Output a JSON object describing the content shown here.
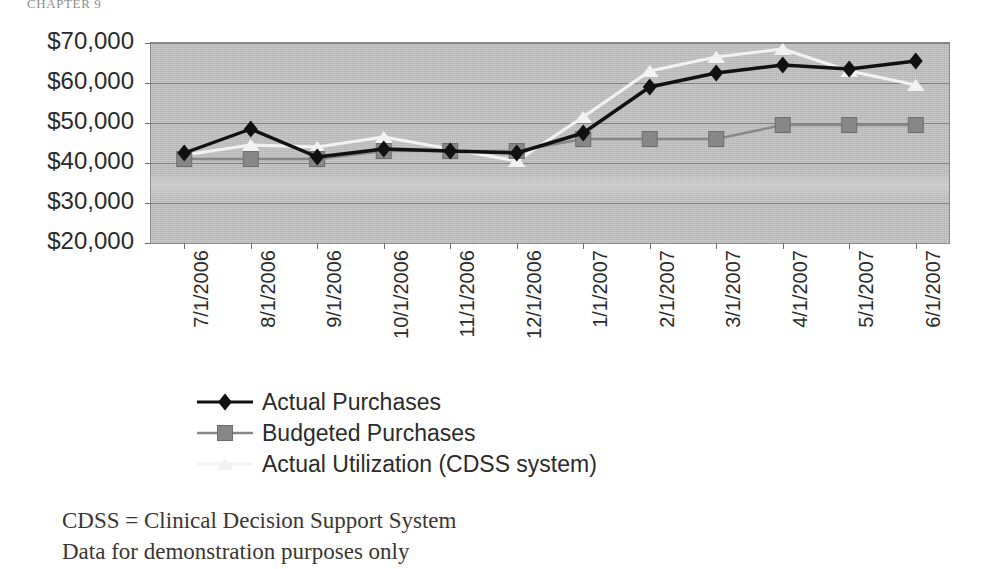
{
  "running_head": "CHAPTER 9",
  "chart_data": {
    "type": "line",
    "title": "",
    "subtitle": "",
    "xlabel": "",
    "ylabel": "",
    "grid": true,
    "legend_position": "bottom",
    "ylim": [
      20000,
      70000
    ],
    "ytick_step": 10000,
    "ytick_labels": [
      "$70,000",
      "$60,000",
      "$50,000",
      "$40,000",
      "$30,000",
      "$20,000"
    ],
    "ytick_values": [
      70000,
      60000,
      50000,
      40000,
      30000,
      20000
    ],
    "categories": [
      "7/1/2006",
      "8/1/2006",
      "9/1/2006",
      "10/1/2006",
      "11/1/2006",
      "12/1/2006",
      "1/1/2007",
      "2/1/2007",
      "3/1/2007",
      "4/1/2007",
      "5/1/2007",
      "6/1/2007"
    ],
    "series": [
      {
        "name": "Actual Purchases",
        "color": "#111111",
        "marker": "diamond",
        "values": [
          42500,
          48500,
          41500,
          43500,
          43000,
          42500,
          47500,
          59000,
          62500,
          64500,
          63500,
          65500
        ]
      },
      {
        "name": "Budgeted Purchases",
        "color": "#878787",
        "marker": "square",
        "values": [
          41000,
          41000,
          41000,
          43000,
          43000,
          43000,
          46000,
          46000,
          46000,
          49500,
          49500,
          49500
        ]
      },
      {
        "name": "Actual Utilization (CDSS system)",
        "color": "#f2f2f2",
        "marker": "triangle",
        "values": [
          42000,
          44500,
          44000,
          46500,
          43500,
          40500,
          51500,
          63000,
          66500,
          68500,
          63000,
          59500
        ]
      }
    ]
  },
  "legend": {
    "items": [
      {
        "label": "Actual Purchases",
        "marker": "diamond",
        "color": "#111111"
      },
      {
        "label": "Budgeted Purchases",
        "marker": "square",
        "color": "#878787"
      },
      {
        "label": "Actual Utilization (CDSS system)",
        "marker": "triangle",
        "color": "#f2f2f2"
      }
    ]
  },
  "footnotes": [
    "CDSS = Clinical Decision Support System",
    "Data for demonstration purposes only"
  ]
}
